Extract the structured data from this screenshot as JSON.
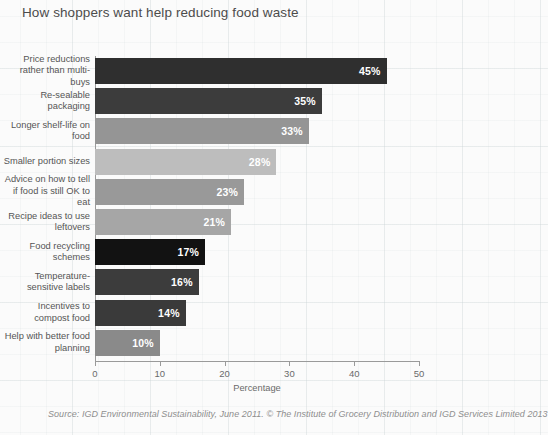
{
  "chart_data": {
    "type": "bar",
    "orientation": "horizontal",
    "title": "How shoppers want help reducing food waste",
    "xlabel": "Percentage",
    "ylabel": "",
    "xlim": [
      0,
      50
    ],
    "xticks": [
      0,
      10,
      20,
      30,
      40,
      50
    ],
    "grid": false,
    "legend": null,
    "categories": [
      "Price reductions rather than multi-buys",
      "Re-sealable packaging",
      "Longer shelf-life on food",
      "Smaller portion sizes",
      "Advice on how to tell if food is still OK to eat",
      "Recipe ideas to use leftovers",
      "Food recycling schemes",
      "Temperature-sensitive labels",
      "Incentives to compost food",
      "Help with better food planning"
    ],
    "values": [
      45,
      35,
      33,
      28,
      23,
      21,
      17,
      16,
      14,
      10
    ],
    "value_labels": [
      "45%",
      "35%",
      "33%",
      "28%",
      "23%",
      "21%",
      "17%",
      "16%",
      "14%",
      "10%"
    ],
    "bar_colors": [
      "#2f2f2f",
      "#3c3c3c",
      "#959595",
      "#bdbdbd",
      "#999999",
      "#a6a6a6",
      "#121212",
      "#3c3c3c",
      "#3a3a3a",
      "#8a8a8a"
    ],
    "source": "Source: IGD Environmental Sustainability, June 2011. © The Institute of Grocery Distribution and IGD Services Limited 2013"
  }
}
